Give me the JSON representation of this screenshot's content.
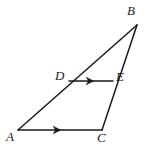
{
  "figure": {
    "kind": "geometry-diagram",
    "background_color": "#ffffff",
    "stroke_color": "#1a1a1a",
    "label_color": "#1a1a1a",
    "stroke_width": 1.5,
    "width": 149,
    "height": 149
  },
  "labels": {
    "a": "A",
    "b": "B",
    "c": "C",
    "d": "D",
    "e": "E"
  },
  "points": {
    "A": {
      "x": 18,
      "y": 130
    },
    "B": {
      "x": 137,
      "y": 25
    },
    "C": {
      "x": 102,
      "y": 130
    },
    "D": {
      "x": 69,
      "y": 81
    },
    "E": {
      "x": 113,
      "y": 81
    }
  },
  "segments": [
    {
      "name": "AB",
      "from": "A",
      "to": "B",
      "tick": "none"
    },
    {
      "name": "BC",
      "from": "B",
      "to": "C",
      "tick": "none"
    },
    {
      "name": "AC",
      "from": "A",
      "to": "C",
      "tick": "single-arrow"
    },
    {
      "name": "DE",
      "from": "D",
      "to": "E",
      "tick": "single-arrow"
    }
  ],
  "arrow_marks": [
    {
      "name": "arrow-on-DE",
      "x": 90,
      "y": 81,
      "direction": "right"
    },
    {
      "name": "arrow-on-AC",
      "x": 57,
      "y": 130,
      "direction": "right"
    }
  ]
}
